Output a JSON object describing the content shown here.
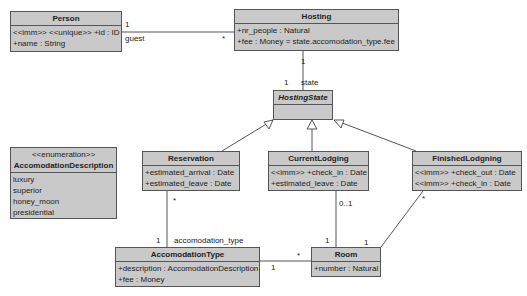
{
  "classes": {
    "person": {
      "name": "Person",
      "attributes": [
        "<<imm>> <<unique>> +id : ID",
        "+name : String"
      ]
    },
    "hosting": {
      "name": "Hosting",
      "attributes": [
        "+nr_people : Natural",
        "+fee : Money = state.accomodation_type.fee"
      ]
    },
    "hosting_state": {
      "name": "HostingState",
      "abstract": true,
      "attributes": []
    },
    "accomodation_description": {
      "stereotype": "<<enumeration>>",
      "name": "AccomodationDescription",
      "literals": [
        "luxury",
        "superior",
        "honey_moon",
        "presidential"
      ]
    },
    "reservation": {
      "name": "Reservation",
      "attributes": [
        "+estimated_arrival : Date",
        "+estimated_leave : Date"
      ]
    },
    "current_lodging": {
      "name": "CurrentLodging",
      "attributes": [
        "<<imm>> +check_in : Date",
        "+estimated_leave : Date"
      ]
    },
    "finished_lodgning": {
      "name": "FinishedLodgning",
      "attributes": [
        "<<imm>> +check_out : Date",
        "<<imm>> +check_in : Date"
      ]
    },
    "accomodation_type": {
      "name": "AccomodationType",
      "attributes": [
        "+description : AccomodationDescription",
        "+fee : Money"
      ]
    },
    "room": {
      "name": "Room",
      "attributes": [
        "+number : Natural"
      ]
    }
  },
  "associations": {
    "person_hosting": {
      "person_mult": "1",
      "role": "guest",
      "hosting_mult": "*"
    },
    "hosting_state": {
      "hosting_mult": "1",
      "state_mult": "1",
      "role": "state"
    },
    "reservation_acctype": {
      "reservation_mult": "*",
      "acctype_mult": "1",
      "role": "accomodation_type"
    },
    "acctype_room": {
      "acctype_mult": "1",
      "room_mult": "*"
    },
    "current_room": {
      "current_mult": "0..1",
      "room_mult": "1"
    },
    "finished_room": {
      "finished_mult": "*",
      "room_mult": "1"
    }
  },
  "colors": {
    "class_fill": "#c9c9c9",
    "border": "#555555",
    "line": "#555555"
  }
}
